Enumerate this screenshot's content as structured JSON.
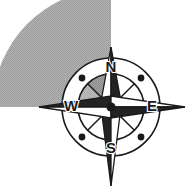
{
  "figure": {
    "name": "compass-rose-with-shaded-sector",
    "width": 192,
    "height": 194,
    "background_color": "#ffffff"
  },
  "compass": {
    "center": {
      "x": 111,
      "y": 107
    },
    "outer_ring_radius": 49,
    "inner_ring_radius": 33,
    "hub_radius": 5,
    "ring_stroke_color": "#1a1a1a",
    "spoke_count": 8,
    "labels": {
      "north": "N",
      "east": "E",
      "south": "S",
      "west": "W"
    },
    "label_positions": {
      "north": {
        "x": 111,
        "y": 68
      },
      "east": {
        "x": 152,
        "y": 107
      },
      "south": {
        "x": 111,
        "y": 149
      },
      "west": {
        "x": 71,
        "y": 107
      }
    },
    "ordinal_dots": [
      {
        "name": "northwest-dot",
        "x": 82,
        "y": 78,
        "r": 3.4
      },
      {
        "name": "northeast-dot",
        "x": 141,
        "y": 78,
        "r": 3.4
      },
      {
        "name": "southwest-dot",
        "x": 82,
        "y": 137,
        "r": 3.4
      },
      {
        "name": "southeast-dot",
        "x": 141,
        "y": 137,
        "r": 3.4
      }
    ],
    "needles": [
      {
        "name": "north-needle",
        "direction": "N",
        "tip_length": 60,
        "half_width": 11,
        "dark_fill": "#232323",
        "light_fill": "#ffffff"
      },
      {
        "name": "east-needle",
        "direction": "E",
        "tip_length": 74,
        "half_width": 11,
        "dark_fill": "#232323",
        "light_fill": "#ffffff"
      },
      {
        "name": "south-needle",
        "direction": "S",
        "tip_length": 79,
        "half_width": 10,
        "dark_fill": "#232323",
        "light_fill": "#ffffff"
      },
      {
        "name": "west-needle",
        "direction": "W",
        "tip_length": 72,
        "half_width": 11,
        "dark_fill": "#232323",
        "light_fill": "#ffffff"
      }
    ]
  },
  "shaded_sector": {
    "name": "northwest-shaded-sector",
    "start_bearing_deg": 270,
    "end_bearing_deg": 360,
    "sweep_deg": 90,
    "outer_radius": 118,
    "inner_radius": 0,
    "fill_color": "#a9a9a9",
    "pattern": "halftone-dither",
    "quadrant": "NW"
  },
  "inner_shaded_wedge": {
    "name": "inner-northwest-wedge",
    "start_bearing_deg": 315,
    "end_bearing_deg": 360,
    "fill_color": "#9a9a9a"
  }
}
